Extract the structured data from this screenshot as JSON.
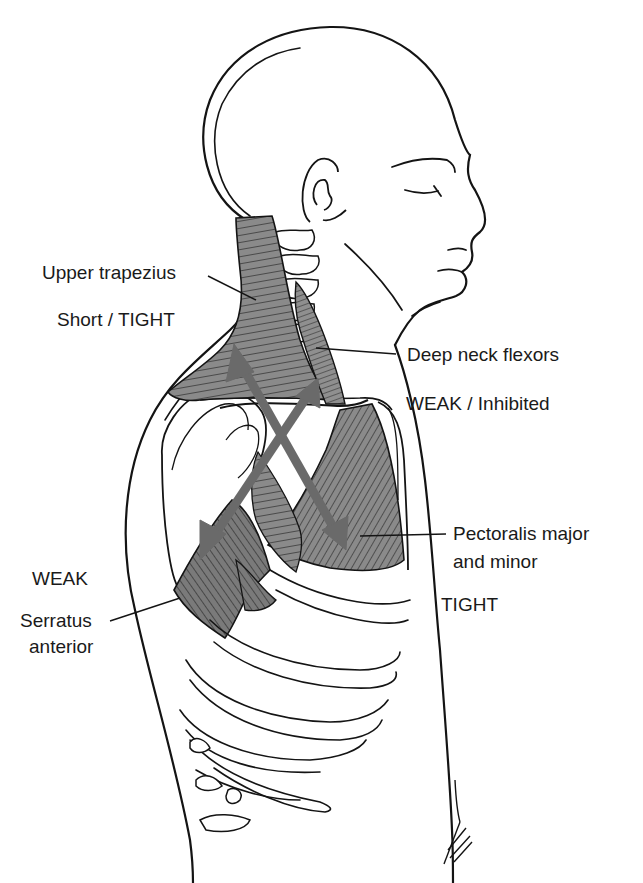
{
  "figure": {
    "colors": {
      "line": "#141414",
      "muscle_fill": "#8a8a8a",
      "muscle_dark": "#6f6f6f",
      "arrow": "#6a6a6a",
      "background": "#ffffff"
    },
    "labels": {
      "upper_trapezius": "Upper trapezius",
      "upper_trapezius_state": "Short / TIGHT",
      "deep_neck_flexors": "Deep neck flexors",
      "deep_neck_flexors_state": "WEAK / Inhibited",
      "pectoralis_line1": "Pectoralis major",
      "pectoralis_line2": "and minor",
      "pectoralis_state": "TIGHT",
      "serratus_state": "WEAK",
      "serratus_line1": "Serratus",
      "serratus_line2": "anterior"
    },
    "signature": "Bellisle"
  }
}
